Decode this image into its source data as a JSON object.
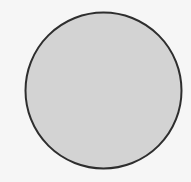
{
  "figure": {
    "shape": "circle",
    "center": [
      103.5,
      90.5
    ],
    "radius": 78,
    "fill_color": "#d3d3d3",
    "stroke_color": "#2e2e2e",
    "stroke_width": 2,
    "background_color": "#f6f6f6"
  }
}
